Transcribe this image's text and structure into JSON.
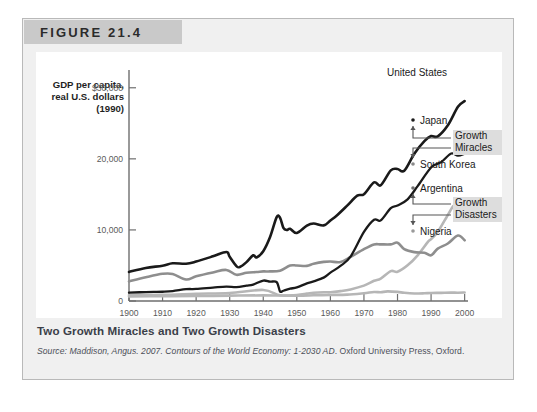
{
  "figure": {
    "number_label": "FIGURE 21.4",
    "caption": "Two Growth Miracles and Two Growth Disasters",
    "source_prefix": "Source: Maddison, Angus. 2007. ",
    "source_title": "Contours of the World Economy: 1-2030 AD",
    "source_suffix": ". Oxford University Press, Oxford."
  },
  "chart_data": {
    "type": "line",
    "title": "Two Growth Miracles and Two Growth Disasters",
    "xlabel": "Year",
    "ylabel": "GDP per capita, real U.S. dollars (1990)",
    "ylabel_lines": [
      "GDP per capita,",
      "real U.S. dollars",
      "(1990)"
    ],
    "grid": false,
    "legend_position": "right-inline-labels",
    "xlim": [
      1900,
      2001
    ],
    "ylim": [
      0,
      32500
    ],
    "xticks": [
      1900,
      1910,
      1920,
      1930,
      1940,
      1950,
      1960,
      1970,
      1980,
      1990,
      2000
    ],
    "xticklabels": [
      "1900",
      "1910",
      "1920",
      "1930",
      "1940",
      "1950",
      "1960",
      "1970",
      "1980",
      "1990",
      "2000"
    ],
    "yticks": [
      0,
      10000,
      20000,
      30000
    ],
    "yticklabels": [
      "0",
      "10,000",
      "20,000",
      "$30,000"
    ],
    "annotations": [
      {
        "text": "Growth Miracles",
        "lines": [
          "Growth",
          "Miracles"
        ],
        "highlight": true,
        "brace_for": [
          "Japan",
          "South Korea"
        ]
      },
      {
        "text": "Growth Disasters",
        "lines": [
          "Growth",
          "Disasters"
        ],
        "highlight": true,
        "brace_for": [
          "Argentina",
          "Nigeria"
        ]
      }
    ],
    "series": [
      {
        "name": "United States",
        "color": "#1a1a1a",
        "width": 2.6,
        "x": [
          1900,
          1905,
          1910,
          1913,
          1917,
          1920,
          1925,
          1929,
          1930,
          1932,
          1933,
          1935,
          1937,
          1938,
          1940,
          1942,
          1944,
          1945,
          1946,
          1947,
          1948,
          1950,
          1953,
          1955,
          1958,
          1960,
          1962,
          1965,
          1968,
          1970,
          1973,
          1975,
          1978,
          1980,
          1982,
          1985,
          1988,
          1990,
          1992,
          1995,
          1998,
          2000
        ],
        "values": [
          4091,
          4642,
          4964,
          5301,
          5248,
          5552,
          6282,
          6899,
          6213,
          4908,
          4777,
          5467,
          6430,
          6126,
          7010,
          8961,
          11799,
          11709,
          10300,
          9980,
          10160,
          9561,
          10610,
          10897,
          10640,
          11328,
          12065,
          13419,
          14824,
          15030,
          16689,
          16284,
          18373,
          18577,
          18325,
          20717,
          22499,
          23201,
          23169,
          24722,
          27331,
          28129
        ]
      },
      {
        "name": "Japan",
        "color": "#1a1a1a",
        "width": 2.3,
        "x": [
          1900,
          1905,
          1910,
          1913,
          1917,
          1920,
          1925,
          1929,
          1932,
          1935,
          1937,
          1940,
          1942,
          1944,
          1945,
          1946,
          1948,
          1950,
          1953,
          1955,
          1958,
          1960,
          1963,
          1966,
          1970,
          1973,
          1975,
          1978,
          1980,
          1983,
          1986,
          1990,
          1993,
          1996,
          1998,
          2000
        ],
        "values": [
          1180,
          1254,
          1304,
          1387,
          1663,
          1696,
          1885,
          2026,
          1940,
          2154,
          2315,
          2874,
          2723,
          2659,
          1346,
          1444,
          1725,
          1921,
          2474,
          2771,
          3290,
          3986,
          4936,
          6232,
          9714,
          11434,
          11344,
          13080,
          13428,
          14309,
          16158,
          18789,
          19532,
          20752,
          20440,
          20738
        ]
      },
      {
        "name": "South Korea",
        "color": "#b6b6b6",
        "width": 2.6,
        "x": [
          1900,
          1910,
          1920,
          1930,
          1940,
          1945,
          1950,
          1953,
          1955,
          1958,
          1960,
          1963,
          1966,
          1970,
          1973,
          1975,
          1978,
          1980,
          1983,
          1986,
          1989,
          1990,
          1992,
          1995,
          1997,
          1998,
          1999,
          2000
        ],
        "values": [
          850,
          869,
          1017,
          1131,
          1555,
          800,
          854,
          1034,
          1164,
          1240,
          1226,
          1387,
          1633,
          2167,
          2840,
          3162,
          4200,
          4114,
          5018,
          6430,
          8280,
          8704,
          9737,
          12102,
          13486,
          11970,
          13276,
          14375
        ]
      },
      {
        "name": "Argentina",
        "color": "#8e8e8e",
        "width": 2.6,
        "x": [
          1900,
          1905,
          1910,
          1913,
          1917,
          1920,
          1925,
          1929,
          1932,
          1935,
          1938,
          1940,
          1942,
          1945,
          1948,
          1950,
          1953,
          1955,
          1958,
          1960,
          1963,
          1966,
          1970,
          1973,
          1975,
          1978,
          1980,
          1982,
          1985,
          1988,
          1990,
          1992,
          1995,
          1998,
          2000
        ],
        "values": [
          2756,
          3339,
          3822,
          3797,
          3020,
          3473,
          4012,
          4367,
          3684,
          3968,
          4072,
          4161,
          4161,
          4271,
          4987,
          4987,
          4939,
          5237,
          5504,
          5559,
          5477,
          6202,
          7302,
          7962,
          7970,
          7970,
          8206,
          7311,
          6873,
          6791,
          6433,
          7377,
          8085,
          9219,
          8544
        ]
      },
      {
        "name": "Nigeria",
        "color": "#b6b6b6",
        "width": 2.6,
        "x": [
          1900,
          1910,
          1920,
          1930,
          1940,
          1950,
          1955,
          1960,
          1965,
          1970,
          1973,
          1975,
          1977,
          1980,
          1982,
          1985,
          1988,
          1990,
          1993,
          1996,
          1998,
          2000
        ],
        "values": [
          650,
          672,
          700,
          753,
          792,
          753,
          800,
          854,
          890,
          1100,
          1270,
          1230,
          1350,
          1280,
          1150,
          1050,
          1080,
          1130,
          1150,
          1180,
          1170,
          1200
        ]
      }
    ]
  }
}
